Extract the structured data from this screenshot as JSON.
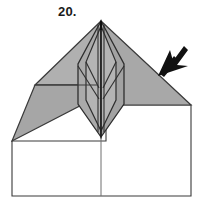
{
  "figure": {
    "step_label": "20.",
    "caption": "",
    "background_color": "#ffffff"
  },
  "palette": {
    "paper_gray": "#a8a8a8",
    "paper_gray_light": "#b4b4b4",
    "paper_gray_dark": "#9a9a9a",
    "paper_white": "#ffffff",
    "outline": "#3a3a3a",
    "crease": "#4a4a4a",
    "arrow": "#111111",
    "text": "#1a1a1a"
  },
  "shapes": {
    "base_sheet": {
      "name": "base-sheet-rectangle",
      "fill": "#ffffff",
      "points": "12,141 12,196 191,196 191,105 106,105 106,141"
    },
    "base_center_crease": {
      "name": "base-center-vertical-crease",
      "x1": 101,
      "y1": 105,
      "x2": 101,
      "y2": 196
    },
    "left_wing_upper": {
      "name": "left-wing-upper-facet",
      "fill": "#b0b0b0",
      "points": "101,21 35,85 85,85 96,60"
    },
    "left_wing_lower": {
      "name": "left-wing-lower-facet",
      "fill": "#a8a8a8",
      "points": "35,85 12,141 96,96 85,85"
    },
    "left_wing_inner": {
      "name": "left-wing-inner-facet",
      "fill": "#a8a8a8",
      "points": "85,85 96,96 96,85"
    },
    "right_wing": {
      "name": "right-wing-triangle-facet",
      "fill": "#a8a8a8",
      "points": "101,21 191,105 106,105 106,60"
    },
    "body_left": {
      "name": "body-left-facet",
      "fill": "#aaaaaa",
      "points": "101,21 78,64 78,104 101,137"
    },
    "body_right": {
      "name": "body-right-facet",
      "fill": "#a4a4a4",
      "points": "101,21 124,64 124,104 101,137"
    },
    "body_inner_left": {
      "name": "body-inner-left-facet",
      "fill": "#b2b2b2",
      "points": "101,28 86,62 86,100 101,130"
    },
    "body_inner_right": {
      "name": "body-inner-right-facet",
      "fill": "#b2b2b2",
      "points": "101,28 116,62 116,100 101,130"
    }
  },
  "creases": [
    {
      "name": "crease-apex-to-left-wing-fold",
      "x1": 101,
      "y1": 21,
      "x2": 35,
      "y2": 85
    },
    {
      "name": "crease-left-wing-horizontal",
      "x1": 35,
      "y1": 85,
      "x2": 96,
      "y2": 85
    },
    {
      "name": "crease-left-wing-tip",
      "x1": 35,
      "y1": 85,
      "x2": 12,
      "y2": 141
    },
    {
      "name": "crease-left-wing-lower-edge",
      "x1": 12,
      "y1": 141,
      "x2": 96,
      "y2": 96
    },
    {
      "name": "crease-apex-to-right-wing-edge",
      "x1": 101,
      "y1": 21,
      "x2": 191,
      "y2": 105
    },
    {
      "name": "crease-right-wing-bottom",
      "x1": 191,
      "y1": 105,
      "x2": 106,
      "y2": 105
    },
    {
      "name": "crease-body-left-outer",
      "x1": 101,
      "y1": 21,
      "x2": 78,
      "y2": 64
    },
    {
      "name": "crease-body-left-vertical",
      "x1": 78,
      "y1": 64,
      "x2": 78,
      "y2": 104
    },
    {
      "name": "crease-body-left-taper",
      "x1": 78,
      "y1": 104,
      "x2": 101,
      "y2": 137
    },
    {
      "name": "crease-body-right-outer",
      "x1": 101,
      "y1": 21,
      "x2": 124,
      "y2": 64
    },
    {
      "name": "crease-body-right-vertical",
      "x1": 124,
      "y1": 64,
      "x2": 124,
      "y2": 104
    },
    {
      "name": "crease-body-right-taper",
      "x1": 124,
      "y1": 104,
      "x2": 101,
      "y2": 137
    },
    {
      "name": "crease-body-inner-left-upper",
      "x1": 101,
      "y1": 26,
      "x2": 86,
      "y2": 62
    },
    {
      "name": "crease-body-inner-left-vertical",
      "x1": 86,
      "y1": 62,
      "x2": 86,
      "y2": 100
    },
    {
      "name": "crease-body-inner-left-lower",
      "x1": 86,
      "y1": 100,
      "x2": 101,
      "y2": 131
    },
    {
      "name": "crease-body-inner-right-upper",
      "x1": 101,
      "y1": 26,
      "x2": 116,
      "y2": 62
    },
    {
      "name": "crease-body-inner-right-vertical",
      "x1": 116,
      "y1": 62,
      "x2": 116,
      "y2": 100
    },
    {
      "name": "crease-body-inner-right-lower",
      "x1": 116,
      "y1": 100,
      "x2": 101,
      "y2": 131
    },
    {
      "name": "crease-body-center-spine",
      "x1": 101,
      "y1": 21,
      "x2": 101,
      "y2": 137
    },
    {
      "name": "crease-body-center-spine-left",
      "x1": 98,
      "y1": 24,
      "x2": 98,
      "y2": 133
    },
    {
      "name": "crease-body-center-spine-right",
      "x1": 104,
      "y1": 24,
      "x2": 104,
      "y2": 133
    },
    {
      "name": "crease-body-diag-left-x",
      "x1": 86,
      "y1": 62,
      "x2": 98,
      "y2": 86
    },
    {
      "name": "crease-body-diag-right-x",
      "x1": 116,
      "y1": 62,
      "x2": 104,
      "y2": 86
    },
    {
      "name": "crease-body-diag-left-x2",
      "x1": 78,
      "y1": 64,
      "x2": 98,
      "y2": 96
    },
    {
      "name": "crease-body-diag-right-x2",
      "x1": 124,
      "y1": 64,
      "x2": 104,
      "y2": 96
    }
  ],
  "arrow": {
    "name": "fold-direction-arrow",
    "direction": "down-left",
    "color": "#111111",
    "tip_x": 160,
    "tip_y": 74,
    "tail_x": 186,
    "tail_y": 47
  }
}
